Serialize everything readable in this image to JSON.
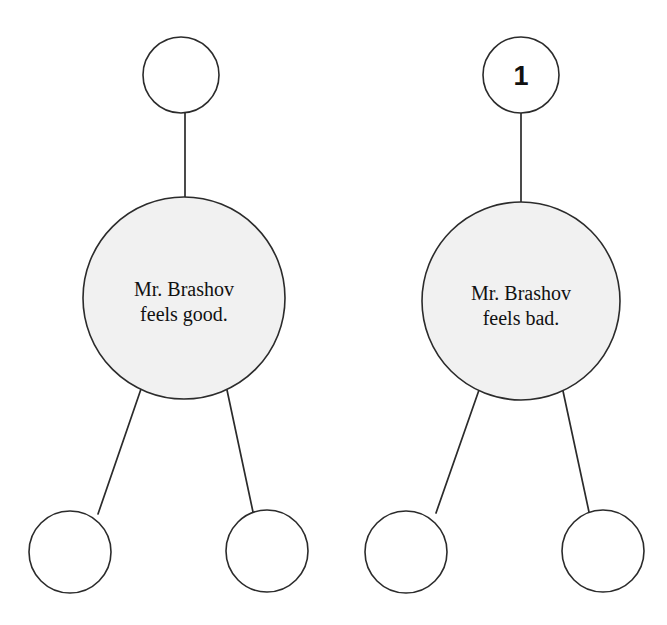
{
  "page": {
    "background_color": "#ffffff",
    "width": 667,
    "height": 625
  },
  "style": {
    "stroke_color": "#2b2b2b",
    "center_fill": "#f1f1f1",
    "empty_fill": "#ffffff",
    "text_color": "#111111"
  },
  "clusters": [
    {
      "id": "cluster-left",
      "number_label": "",
      "top_node": {
        "label": ""
      },
      "center_node": {
        "line1": "Mr. Brashov",
        "line2": "feels good."
      },
      "bottom_left_node": {
        "label": ""
      },
      "bottom_right_node": {
        "label": ""
      }
    },
    {
      "id": "cluster-right",
      "number_label": "1",
      "top_node": {
        "label": "1"
      },
      "center_node": {
        "line1": "Mr. Brashov",
        "line2": "feels bad."
      },
      "bottom_left_node": {
        "label": ""
      },
      "bottom_right_node": {
        "label": ""
      }
    }
  ]
}
